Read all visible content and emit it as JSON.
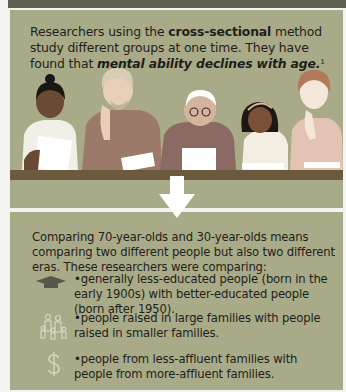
{
  "intro": {
    "part1": "Researchers using the ",
    "bold": "cross-sectional",
    "part2": " method study different groups at one time. They have found that ",
    "italic": "mental ability declines with age.",
    "footnote": "1"
  },
  "arrow": {
    "icon": "down-arrow-icon",
    "color": "#ffffff"
  },
  "comparison": {
    "lead": "Comparing 70-year-olds and 30-year-olds means comparing two different people but also two different eras. These researchers were comparing:",
    "items": [
      {
        "icon": "graduation-cap-icon",
        "text": "•generally less-educated people (born in the early 1900s) with better-educated people (born after 1950)."
      },
      {
        "icon": "family-icon",
        "text": "•people raised in large families with people raised in smaller families."
      },
      {
        "icon": "dollar-sign-icon",
        "text": "•people from less-affluent families with people from more-affluent families."
      }
    ]
  },
  "colors": {
    "panel": "#a9ab88",
    "table": "#6b5a3e",
    "topbar": "#5e6152",
    "icon": "#c9cab3"
  }
}
